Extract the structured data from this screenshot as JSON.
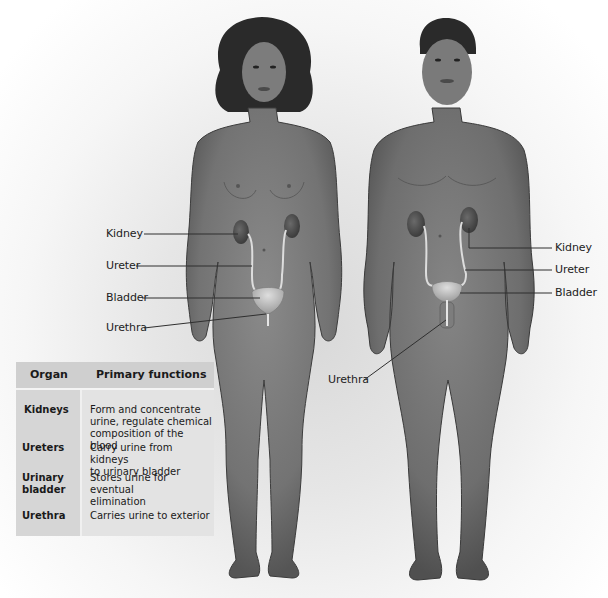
{
  "figure": {
    "style": "grayscale anatomical illustration"
  },
  "female_labels": [
    {
      "text": "Kidney"
    },
    {
      "text": "Ureter"
    },
    {
      "text": "Bladder"
    },
    {
      "text": "Urethra"
    }
  ],
  "male_labels": [
    {
      "text": "Kidney"
    },
    {
      "text": "Ureter"
    },
    {
      "text": "Bladder"
    },
    {
      "text": "Urethra"
    }
  ],
  "table": {
    "headers": [
      "Organ",
      "Primary functions"
    ],
    "rows": [
      {
        "organ": "Kidneys",
        "function": "Form and concentrate\nurine, regulate chemical\ncomposition of the blood"
      },
      {
        "organ": "Ureters",
        "function": "Carry urine from kidneys\nto urinary bladder"
      },
      {
        "organ": "Urinary\nbladder",
        "function": "Stores urine for eventual\nelimination"
      },
      {
        "organ": "Urethra",
        "function": "Carries urine to exterior"
      }
    ]
  },
  "colors": {
    "skin": "#7a7a7a",
    "skin_dark": "#5a5a5a",
    "kidney": "#555555",
    "bladder": "#c8c8c8",
    "table_header": "#cfcfcf",
    "table_body": "#e3e3e3"
  }
}
